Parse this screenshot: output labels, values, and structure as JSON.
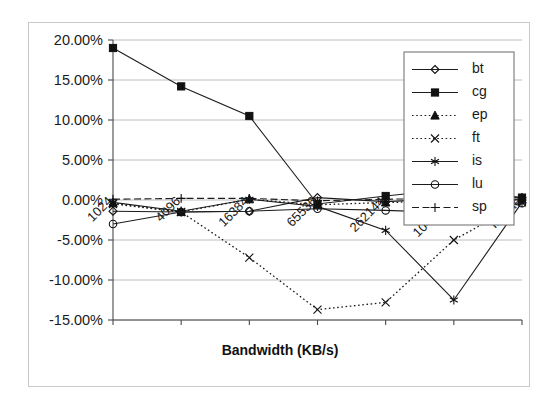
{
  "chart_data": {
    "type": "line",
    "title": "",
    "xlabel": "Bandwidth (KB/s)",
    "ylabel": "",
    "categories": [
      "1024",
      "4096",
      "16384",
      "65536",
      "262144",
      "1048576",
      "Infinite"
    ],
    "ylim": [
      -15,
      20
    ],
    "ytick_labels": [
      "20.00%",
      "15.00%",
      "10.00%",
      "5.00%",
      "0.00%",
      "-5.00%",
      "-10.00%",
      "-15.00%"
    ],
    "ytick_values": [
      20,
      15,
      10,
      5,
      0,
      -5,
      -10,
      -15
    ],
    "grid": true,
    "legend_position": "right-top",
    "value_unit": "percent",
    "series": [
      {
        "name": "bt",
        "marker": "open-diamond",
        "line_style": "solid",
        "values": [
          -1.4,
          -1.5,
          -1.4,
          0.3,
          -0.2,
          0.2,
          0.3
        ]
      },
      {
        "name": "cg",
        "marker": "filled-square",
        "line_style": "solid",
        "values": [
          19.0,
          14.2,
          10.5,
          -0.5,
          0.5,
          1.4,
          0.3
        ]
      },
      {
        "name": "ep",
        "marker": "filled-triangle",
        "line_style": "dotted",
        "values": [
          -0.4,
          -1.5,
          0.1,
          -0.6,
          -0.3,
          -0.2,
          0.1
        ]
      },
      {
        "name": "ft",
        "marker": "cross-x",
        "line_style": "dotted",
        "values": [
          -0.5,
          -1.5,
          -7.2,
          -13.7,
          -12.8,
          -5.0,
          -0.3
        ]
      },
      {
        "name": "is",
        "marker": "asterisk",
        "line_style": "solid",
        "values": [
          -0.3,
          -1.4,
          0.1,
          -0.8,
          -3.8,
          -12.5,
          -0.3
        ]
      },
      {
        "name": "lu",
        "marker": "open-circle",
        "line_style": "solid",
        "values": [
          -3.0,
          -1.5,
          -1.4,
          -1.1,
          -1.3,
          -1.6,
          -0.4
        ]
      },
      {
        "name": "sp",
        "marker": "plus",
        "line_style": "dashed",
        "values": [
          0.1,
          0.2,
          0.2,
          -0.1,
          0.1,
          0.2,
          0.0
        ]
      }
    ]
  },
  "legend": {
    "entries": [
      {
        "label": "bt"
      },
      {
        "label": "cg"
      },
      {
        "label": "ep"
      },
      {
        "label": "ft"
      },
      {
        "label": "is"
      },
      {
        "label": "lu"
      },
      {
        "label": "sp"
      }
    ]
  },
  "colors": {
    "line": "#1c1c1c",
    "grid": "#b4b4b4",
    "axis": "#4a4a4a",
    "background": "#ffffff",
    "frame": "#c9c9c9"
  }
}
